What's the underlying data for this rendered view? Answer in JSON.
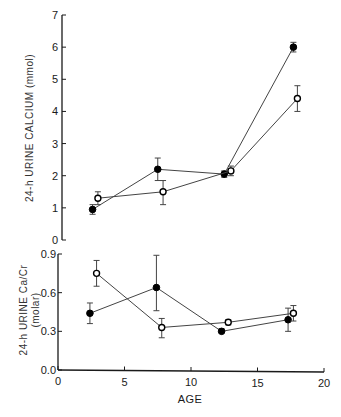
{
  "chart_data": [
    {
      "type": "line",
      "panel": "top",
      "title": "",
      "xlabel": "AGE",
      "ylabel": "24-h URINE CALCIUM (mmol)",
      "xlim": [
        0,
        20
      ],
      "ylim": [
        0,
        7
      ],
      "x_ticks": [
        "0",
        "5",
        "10",
        "15",
        "20"
      ],
      "y_ticks": [
        "0",
        "1",
        "2",
        "3",
        "4",
        "5",
        "6",
        "7"
      ],
      "grid": false,
      "legend": null,
      "series": [
        {
          "name": "filled circles",
          "marker": "filled",
          "x": [
            2.6,
            7.5,
            12.5,
            17.7
          ],
          "values": [
            0.95,
            2.2,
            2.05,
            6.0
          ],
          "error_low": [
            0.8,
            1.85,
            1.95,
            5.85
          ],
          "error_high": [
            1.1,
            2.55,
            2.15,
            6.15
          ]
        },
        {
          "name": "open circles",
          "marker": "open",
          "x": [
            3.0,
            7.9,
            13.0,
            18.0
          ],
          "values": [
            1.3,
            1.5,
            2.15,
            4.4
          ],
          "error_low": [
            1.1,
            1.1,
            2.0,
            4.0
          ],
          "error_high": [
            1.5,
            1.85,
            2.3,
            4.8
          ]
        }
      ]
    },
    {
      "type": "line",
      "panel": "bottom",
      "title": "",
      "xlabel": "AGE",
      "ylabel": "24-h URINE Ca/Cr (molar)",
      "xlim": [
        0,
        20
      ],
      "ylim": [
        0.0,
        0.9
      ],
      "x_ticks": [
        "0",
        "5",
        "10",
        "15",
        "20"
      ],
      "y_ticks": [
        "0.0",
        "0.3",
        "0.6",
        "0.9"
      ],
      "grid": false,
      "legend": null,
      "series": [
        {
          "name": "filled circles",
          "marker": "filled",
          "x": [
            2.4,
            7.4,
            12.3,
            17.3
          ],
          "values": [
            0.44,
            0.64,
            0.3,
            0.39
          ],
          "error_low": [
            0.36,
            0.46,
            0.29,
            0.3
          ],
          "error_high": [
            0.52,
            0.89,
            0.32,
            0.48
          ]
        },
        {
          "name": "open circles",
          "marker": "open",
          "x": [
            2.9,
            7.8,
            12.8,
            17.7
          ],
          "values": [
            0.75,
            0.33,
            0.37,
            0.44
          ],
          "error_low": [
            0.65,
            0.25,
            0.35,
            0.38
          ],
          "error_high": [
            0.85,
            0.4,
            0.39,
            0.5
          ]
        }
      ]
    }
  ],
  "labels": {
    "top_ylabel": "24-h URINE CALCIUM (mmol)",
    "bottom_ylabel_line1": "24-h URINE Ca/Cr",
    "bottom_ylabel_line2": "(molar)",
    "xlabel": "AGE",
    "top_yticks": [
      "0",
      "1",
      "2",
      "3",
      "4",
      "5",
      "6",
      "7"
    ],
    "bottom_yticks": [
      "0.0",
      "0.3",
      "0.6",
      "0.9"
    ],
    "xticks": [
      "0",
      "5",
      "10",
      "15",
      "20"
    ]
  },
  "colors": {
    "ink": "#1a1a1a",
    "line": "#444444",
    "background": "#ffffff"
  }
}
